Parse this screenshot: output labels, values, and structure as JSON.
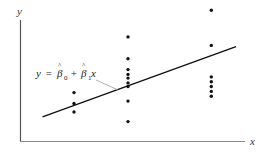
{
  "chart_data": {
    "type": "scatter",
    "title": "",
    "xlabel": "x",
    "ylabel": "y",
    "xlim": [
      0,
      10
    ],
    "ylim": [
      0,
      10
    ],
    "grid": false,
    "legend": null,
    "axes_ticks": "none",
    "series": [
      {
        "name": "observations",
        "points": [
          {
            "x": 2.4,
            "y": 4.0
          },
          {
            "x": 2.4,
            "y": 3.1
          },
          {
            "x": 2.4,
            "y": 2.4
          },
          {
            "x": 4.8,
            "y": 8.6
          },
          {
            "x": 4.8,
            "y": 6.8
          },
          {
            "x": 4.8,
            "y": 5.9
          },
          {
            "x": 4.8,
            "y": 5.5
          },
          {
            "x": 4.8,
            "y": 5.2
          },
          {
            "x": 4.8,
            "y": 4.8
          },
          {
            "x": 4.8,
            "y": 4.5
          },
          {
            "x": 4.8,
            "y": 3.3
          },
          {
            "x": 4.8,
            "y": 1.6
          },
          {
            "x": 8.5,
            "y": 10.8
          },
          {
            "x": 8.5,
            "y": 7.9
          },
          {
            "x": 8.5,
            "y": 5.3
          },
          {
            "x": 8.5,
            "y": 4.9
          },
          {
            "x": 8.5,
            "y": 4.5
          },
          {
            "x": 8.5,
            "y": 4.1
          },
          {
            "x": 8.5,
            "y": 3.7
          }
        ]
      },
      {
        "name": "fitted regression line",
        "type": "line",
        "points": [
          {
            "x": 1.0,
            "y": 2.0
          },
          {
            "x": 9.6,
            "y": 7.8
          }
        ]
      }
    ],
    "annotations": [
      {
        "text": "y = β̂0 + β̂1x",
        "points_to": "fitted regression line"
      }
    ]
  },
  "labels": {
    "y_axis": "y",
    "x_axis": "x",
    "equation": {
      "lhs": "y",
      "equals": " = ",
      "beta": "β",
      "hat": "^",
      "sub0": "0",
      "plus": " + ",
      "sub1": "1",
      "var": "x"
    }
  },
  "colors": {
    "axis": "#888888",
    "y_axis": "#555555",
    "points": "#111111",
    "line": "#111111",
    "pointer": "#999999"
  }
}
